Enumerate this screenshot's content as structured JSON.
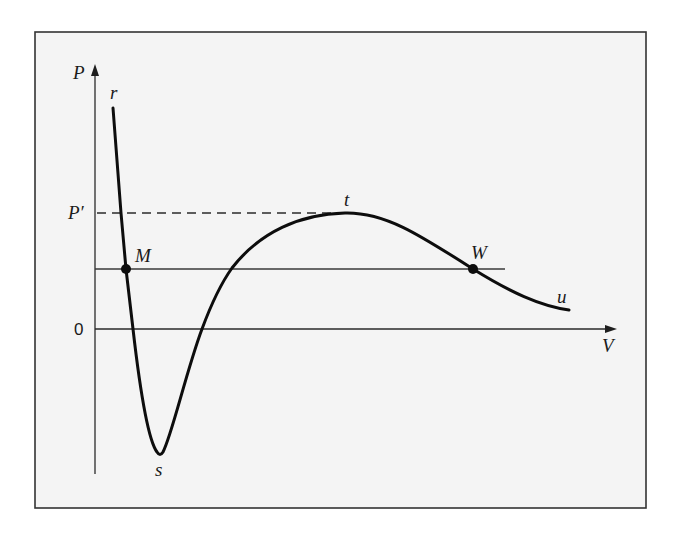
{
  "figure": {
    "type": "P-V isotherm diagram (van der Waals-like loop)",
    "axes": {
      "y_label": "P",
      "x_label": "V",
      "origin_label": "0",
      "reference_pressure_label": "P′"
    },
    "curve_points": {
      "r": "r",
      "s": "s",
      "t": "t",
      "u": "u"
    },
    "marked_points": {
      "M": "M",
      "W": "W"
    },
    "lines": {
      "horizontal_solid": "line through M and W",
      "horizontal_dashed": "dashed line from P′ to t"
    },
    "colors": {
      "background": "#ffffff",
      "frame_fill": "#f4f4f4",
      "frame_stroke": "#333333",
      "curve": "#0d0d0d",
      "axes": "#2a2a2a"
    }
  }
}
